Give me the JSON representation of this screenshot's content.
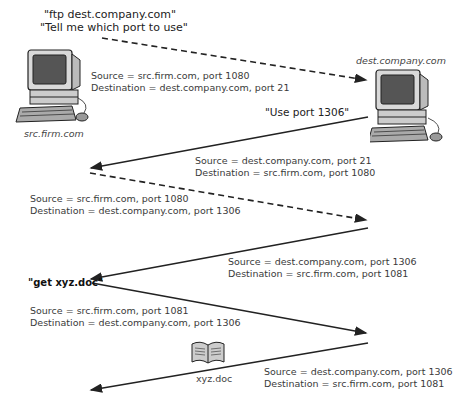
{
  "hosts": {
    "source": {
      "name": "src.firm.com"
    },
    "destination": {
      "name": "dest.company.com"
    }
  },
  "messages": {
    "ftp_request_line1": "\"ftp dest.company.com\"",
    "ftp_request_line2": "\"Tell me which port to use\"",
    "port_reply": "\"Use port 1306\"",
    "get_request": "\"get xyz.doc\""
  },
  "file": {
    "name": "xyz.doc"
  },
  "arrows": [
    {
      "style": "dashed",
      "direction": "src-to-dest",
      "source": "Source = src.firm.com, port 1080",
      "destination": "Destination = dest.company.com, port 21"
    },
    {
      "style": "solid",
      "direction": "dest-to-src",
      "source": "Source = dest.company.com, port 21",
      "destination": "Destination = src.firm.com, port 1080"
    },
    {
      "style": "dashed",
      "direction": "src-to-dest",
      "source": "Source = src.firm.com, port 1080",
      "destination": "Destination = dest.company.com, port 1306"
    },
    {
      "style": "solid",
      "direction": "dest-to-src",
      "source": "Source = dest.company.com, port 1306",
      "destination": "Destination = src.firm.com, port 1081"
    },
    {
      "style": "solid",
      "direction": "src-to-dest",
      "source": "Source = src.firm.com, port 1081",
      "destination": "Destination = dest.company.com, port 1306"
    },
    {
      "style": "solid",
      "direction": "dest-to-src",
      "source": "Source = dest.company.com, port 1306",
      "destination": "Destination = src.firm.com, port 1081"
    }
  ]
}
